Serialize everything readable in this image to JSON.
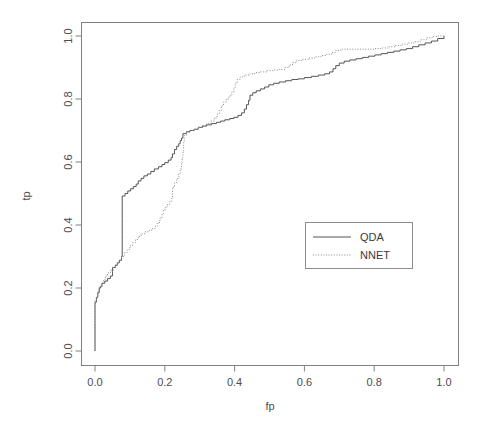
{
  "chart_data": {
    "type": "line",
    "title": "",
    "xlabel": "fp",
    "ylabel": "tp",
    "xlim": [
      0,
      1
    ],
    "ylim": [
      0,
      1
    ],
    "grid": false,
    "legend_position": "bottom-right",
    "xticks": [
      "0.0",
      "0.2",
      "0.4",
      "0.6",
      "0.8",
      "1.0"
    ],
    "xtick_values": [
      0.0,
      0.2,
      0.4,
      0.6,
      0.8,
      1.0
    ],
    "yticks": [
      "0.0",
      "0.2",
      "0.4",
      "0.6",
      "0.8",
      "1.0"
    ],
    "ytick_values": [
      0.0,
      0.2,
      0.4,
      0.6,
      0.8,
      1.0
    ],
    "series": [
      {
        "name": "QDA",
        "style": "solid",
        "color": "#555555",
        "points": [
          [
            0.0,
            0.0
          ],
          [
            0.0,
            0.09
          ],
          [
            0.0,
            0.155
          ],
          [
            0.004,
            0.17
          ],
          [
            0.008,
            0.185
          ],
          [
            0.012,
            0.2
          ],
          [
            0.016,
            0.205
          ],
          [
            0.02,
            0.215
          ],
          [
            0.028,
            0.222
          ],
          [
            0.036,
            0.23
          ],
          [
            0.044,
            0.238
          ],
          [
            0.05,
            0.252
          ],
          [
            0.05,
            0.265
          ],
          [
            0.058,
            0.272
          ],
          [
            0.064,
            0.28
          ],
          [
            0.07,
            0.288
          ],
          [
            0.076,
            0.3
          ],
          [
            0.078,
            0.33
          ],
          [
            0.078,
            0.37
          ],
          [
            0.078,
            0.42
          ],
          [
            0.078,
            0.47
          ],
          [
            0.078,
            0.492
          ],
          [
            0.086,
            0.5
          ],
          [
            0.094,
            0.508
          ],
          [
            0.102,
            0.515
          ],
          [
            0.11,
            0.522
          ],
          [
            0.118,
            0.53
          ],
          [
            0.124,
            0.54
          ],
          [
            0.132,
            0.548
          ],
          [
            0.14,
            0.556
          ],
          [
            0.15,
            0.562
          ],
          [
            0.16,
            0.57
          ],
          [
            0.17,
            0.578
          ],
          [
            0.182,
            0.585
          ],
          [
            0.192,
            0.592
          ],
          [
            0.2,
            0.598
          ],
          [
            0.21,
            0.606
          ],
          [
            0.218,
            0.614
          ],
          [
            0.222,
            0.626
          ],
          [
            0.228,
            0.64
          ],
          [
            0.234,
            0.65
          ],
          [
            0.24,
            0.658
          ],
          [
            0.244,
            0.668
          ],
          [
            0.248,
            0.676
          ],
          [
            0.252,
            0.69
          ],
          [
            0.262,
            0.696
          ],
          [
            0.272,
            0.7
          ],
          [
            0.284,
            0.704
          ],
          [
            0.296,
            0.71
          ],
          [
            0.308,
            0.714
          ],
          [
            0.32,
            0.718
          ],
          [
            0.334,
            0.722
          ],
          [
            0.348,
            0.726
          ],
          [
            0.36,
            0.73
          ],
          [
            0.372,
            0.734
          ],
          [
            0.386,
            0.738
          ],
          [
            0.398,
            0.742
          ],
          [
            0.41,
            0.748
          ],
          [
            0.42,
            0.756
          ],
          [
            0.428,
            0.768
          ],
          [
            0.434,
            0.782
          ],
          [
            0.44,
            0.796
          ],
          [
            0.444,
            0.812
          ],
          [
            0.452,
            0.82
          ],
          [
            0.462,
            0.826
          ],
          [
            0.474,
            0.832
          ],
          [
            0.486,
            0.838
          ],
          [
            0.498,
            0.845
          ],
          [
            0.512,
            0.85
          ],
          [
            0.528,
            0.854
          ],
          [
            0.546,
            0.858
          ],
          [
            0.564,
            0.862
          ],
          [
            0.582,
            0.864
          ],
          [
            0.6,
            0.868
          ],
          [
            0.62,
            0.872
          ],
          [
            0.64,
            0.876
          ],
          [
            0.658,
            0.88
          ],
          [
            0.672,
            0.886
          ],
          [
            0.682,
            0.896
          ],
          [
            0.69,
            0.906
          ],
          [
            0.7,
            0.914
          ],
          [
            0.714,
            0.92
          ],
          [
            0.73,
            0.924
          ],
          [
            0.748,
            0.928
          ],
          [
            0.766,
            0.932
          ],
          [
            0.784,
            0.936
          ],
          [
            0.802,
            0.94
          ],
          [
            0.82,
            0.944
          ],
          [
            0.838,
            0.948
          ],
          [
            0.856,
            0.952
          ],
          [
            0.874,
            0.956
          ],
          [
            0.892,
            0.96
          ],
          [
            0.91,
            0.966
          ],
          [
            0.928,
            0.972
          ],
          [
            0.946,
            0.978
          ],
          [
            0.964,
            0.984
          ],
          [
            0.982,
            0.992
          ],
          [
            1.0,
            1.0
          ]
        ]
      },
      {
        "name": "NNET",
        "style": "dotted",
        "color": "#8c8c8c",
        "points": [
          [
            0.0,
            0.0
          ],
          [
            0.0,
            0.1
          ],
          [
            0.0,
            0.16
          ],
          [
            0.004,
            0.175
          ],
          [
            0.008,
            0.19
          ],
          [
            0.012,
            0.205
          ],
          [
            0.018,
            0.215
          ],
          [
            0.024,
            0.226
          ],
          [
            0.03,
            0.238
          ],
          [
            0.036,
            0.248
          ],
          [
            0.044,
            0.256
          ],
          [
            0.052,
            0.266
          ],
          [
            0.06,
            0.276
          ],
          [
            0.068,
            0.288
          ],
          [
            0.076,
            0.3
          ],
          [
            0.084,
            0.312
          ],
          [
            0.092,
            0.322
          ],
          [
            0.1,
            0.334
          ],
          [
            0.108,
            0.344
          ],
          [
            0.116,
            0.354
          ],
          [
            0.124,
            0.364
          ],
          [
            0.132,
            0.372
          ],
          [
            0.142,
            0.378
          ],
          [
            0.152,
            0.382
          ],
          [
            0.162,
            0.388
          ],
          [
            0.172,
            0.396
          ],
          [
            0.18,
            0.408
          ],
          [
            0.186,
            0.422
          ],
          [
            0.192,
            0.436
          ],
          [
            0.196,
            0.448
          ],
          [
            0.202,
            0.458
          ],
          [
            0.208,
            0.466
          ],
          [
            0.214,
            0.474
          ],
          [
            0.22,
            0.484
          ],
          [
            0.222,
            0.5
          ],
          [
            0.222,
            0.52
          ],
          [
            0.228,
            0.534
          ],
          [
            0.234,
            0.548
          ],
          [
            0.24,
            0.562
          ],
          [
            0.244,
            0.578
          ],
          [
            0.248,
            0.596
          ],
          [
            0.25,
            0.614
          ],
          [
            0.252,
            0.636
          ],
          [
            0.254,
            0.662
          ],
          [
            0.256,
            0.684
          ],
          [
            0.262,
            0.694
          ],
          [
            0.272,
            0.7
          ],
          [
            0.284,
            0.704
          ],
          [
            0.296,
            0.71
          ],
          [
            0.308,
            0.716
          ],
          [
            0.32,
            0.722
          ],
          [
            0.332,
            0.73
          ],
          [
            0.342,
            0.74
          ],
          [
            0.35,
            0.752
          ],
          [
            0.356,
            0.764
          ],
          [
            0.362,
            0.778
          ],
          [
            0.368,
            0.79
          ],
          [
            0.376,
            0.8
          ],
          [
            0.384,
            0.81
          ],
          [
            0.392,
            0.822
          ],
          [
            0.398,
            0.836
          ],
          [
            0.402,
            0.85
          ],
          [
            0.408,
            0.862
          ],
          [
            0.416,
            0.87
          ],
          [
            0.428,
            0.876
          ],
          [
            0.442,
            0.88
          ],
          [
            0.458,
            0.884
          ],
          [
            0.474,
            0.886
          ],
          [
            0.492,
            0.89
          ],
          [
            0.51,
            0.892
          ],
          [
            0.528,
            0.894
          ],
          [
            0.544,
            0.9
          ],
          [
            0.556,
            0.908
          ],
          [
            0.566,
            0.916
          ],
          [
            0.578,
            0.922
          ],
          [
            0.594,
            0.926
          ],
          [
            0.612,
            0.93
          ],
          [
            0.63,
            0.934
          ],
          [
            0.648,
            0.938
          ],
          [
            0.664,
            0.942
          ],
          [
            0.678,
            0.948
          ],
          [
            0.69,
            0.954
          ],
          [
            0.704,
            0.958
          ],
          [
            0.722,
            0.958
          ],
          [
            0.742,
            0.958
          ],
          [
            0.762,
            0.958
          ],
          [
            0.782,
            0.958
          ],
          [
            0.802,
            0.96
          ],
          [
            0.822,
            0.962
          ],
          [
            0.842,
            0.966
          ],
          [
            0.86,
            0.97
          ],
          [
            0.878,
            0.974
          ],
          [
            0.896,
            0.978
          ],
          [
            0.914,
            0.982
          ],
          [
            0.932,
            0.988
          ],
          [
            0.95,
            0.994
          ],
          [
            0.966,
            0.998
          ],
          [
            0.982,
            1.0
          ],
          [
            1.0,
            1.0
          ]
        ]
      }
    ]
  },
  "legend": {
    "entries": [
      {
        "label": "QDA"
      },
      {
        "label": "NNET"
      }
    ]
  },
  "axes": {
    "x_title": "fp",
    "y_title": "tp"
  }
}
